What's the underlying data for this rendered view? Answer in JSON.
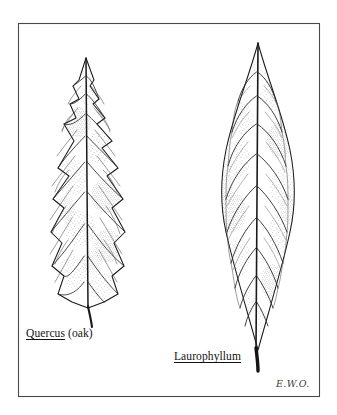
{
  "plate": {
    "background_color": "#ffffff",
    "frame": {
      "color": "#4a4a4a",
      "x": 18,
      "y": 23,
      "width": 302,
      "height": 374
    },
    "ink_color": "#1a1a1a",
    "stipple_color": "#555555",
    "vein_color": "#2b2b2b"
  },
  "figures": [
    {
      "id": "quercus-leaf",
      "name": "quercus-leaf-illustration",
      "genus_label": "Quercus",
      "common_label": "(oak)",
      "margin_type": "toothed",
      "tip": {
        "x": 86,
        "y": 58
      },
      "base": {
        "x": 88,
        "y": 308
      },
      "petiole_end": {
        "x": 92,
        "y": 327
      },
      "widest_span": {
        "left_x": 52,
        "right_x": 125,
        "y": 245
      }
    },
    {
      "id": "laurophyllum-leaf",
      "name": "laurophyllum-leaf-illustration",
      "genus_label": "Laurophyllum",
      "common_label": "",
      "margin_type": "entire",
      "tip": {
        "x": 258,
        "y": 43
      },
      "base": {
        "x": 256,
        "y": 350
      },
      "petiole_end": {
        "x": 258,
        "y": 371
      },
      "widest_span": {
        "left_x": 213,
        "right_x": 296,
        "y": 195
      }
    }
  ],
  "labels": {
    "quercus": {
      "genus": "Quercus",
      "common": "(oak)"
    },
    "laurophyllum": {
      "genus": "Laurophyllum",
      "common": ""
    }
  },
  "signature": {
    "text": "E.W.O."
  }
}
